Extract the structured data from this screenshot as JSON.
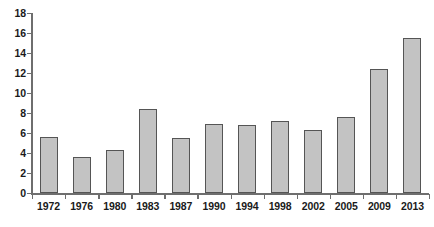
{
  "chart_data": {
    "type": "bar",
    "title": "",
    "subtitle": "",
    "xlabel": "",
    "ylabel": "",
    "categories": [
      "1972",
      "1976",
      "1980",
      "1983",
      "1987",
      "1990",
      "1994",
      "1998",
      "2002",
      "2005",
      "2009",
      "2013"
    ],
    "values": [
      5.6,
      3.6,
      4.3,
      8.4,
      5.5,
      6.9,
      6.8,
      7.2,
      6.3,
      7.6,
      12.4,
      15.5
    ],
    "series": [
      {
        "name": "",
        "values": [
          5.6,
          3.6,
          4.3,
          8.4,
          5.5,
          6.9,
          6.8,
          7.2,
          6.3,
          7.6,
          12.4,
          15.5
        ]
      }
    ],
    "ylim": [
      0,
      18
    ],
    "ytick_step": 2,
    "ytick_labels": [
      "0",
      "2",
      "4",
      "6",
      "8",
      "10",
      "12",
      "14",
      "16",
      "18"
    ],
    "ytick_values": [
      0,
      2,
      4,
      6,
      8,
      10,
      12,
      14,
      16,
      18
    ],
    "xlim": [
      0,
      12
    ],
    "grid": false,
    "legend": false,
    "legend_position": "none",
    "bar_fill_color": "#c3c3c3",
    "bar_border_color": "#555555",
    "axis_color": "#6e6e6e",
    "text_color": "#1a1a1a",
    "background_color": "#ffffff",
    "annotations": []
  }
}
